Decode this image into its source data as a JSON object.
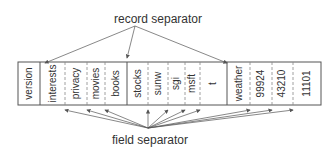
{
  "labels": {
    "top": "record separator",
    "bottom": "field separator"
  },
  "box": {
    "x": 18,
    "y": 62,
    "width": 303,
    "height": 43
  },
  "record_separators_x": [
    40,
    127,
    227
  ],
  "field_separators_x": [
    65,
    87,
    105,
    148,
    168,
    185,
    200,
    250,
    272,
    293
  ],
  "fields": [
    {
      "text": "version",
      "x": 29
    },
    {
      "text": "interests",
      "x": 53
    },
    {
      "text": "privacy",
      "x": 76
    },
    {
      "text": "movies",
      "x": 96
    },
    {
      "text": "books",
      "x": 116
    },
    {
      "text": "stocks",
      "x": 138
    },
    {
      "text": "sunw",
      "x": 158
    },
    {
      "text": "sgi",
      "x": 176
    },
    {
      "text": "msft",
      "x": 192
    },
    {
      "text": "t",
      "x": 213
    },
    {
      "text": "weather",
      "x": 239
    },
    {
      "text": "99924",
      "x": 261
    },
    {
      "text": "43210",
      "x": 282
    },
    {
      "text": "11101",
      "x": 307
    }
  ],
  "colors": {
    "line": "#555555",
    "text": "#333333"
  }
}
